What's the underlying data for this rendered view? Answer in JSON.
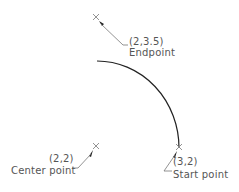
{
  "diagram": {
    "type": "arc-construction",
    "colors": {
      "line": "#222222",
      "marker": "#888888",
      "text": "#555555",
      "background": "#ffffff"
    },
    "points": [
      {
        "id": "endpoint",
        "coords": "(2,3.5)",
        "label": "Endpoint"
      },
      {
        "id": "center",
        "coords": "(2,2)",
        "label": "Center point"
      },
      {
        "id": "start",
        "coords": "(3,2)",
        "label": "Start point"
      }
    ],
    "arc": {
      "from": "start",
      "to": "endpoint",
      "center": "center"
    }
  }
}
